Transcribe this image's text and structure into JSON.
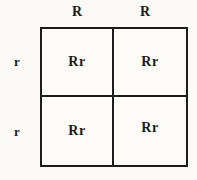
{
  "punnett_square": {
    "col_labels": [
      "R",
      "R"
    ],
    "row_labels": [
      "r",
      "r"
    ],
    "cells": [
      [
        "Rr",
        "Rr"
      ],
      [
        "Rr",
        "Rr"
      ]
    ],
    "colors": {
      "line": "#1c1c1c",
      "text": "#1b1b1b",
      "background": "#fbfaf6"
    }
  }
}
